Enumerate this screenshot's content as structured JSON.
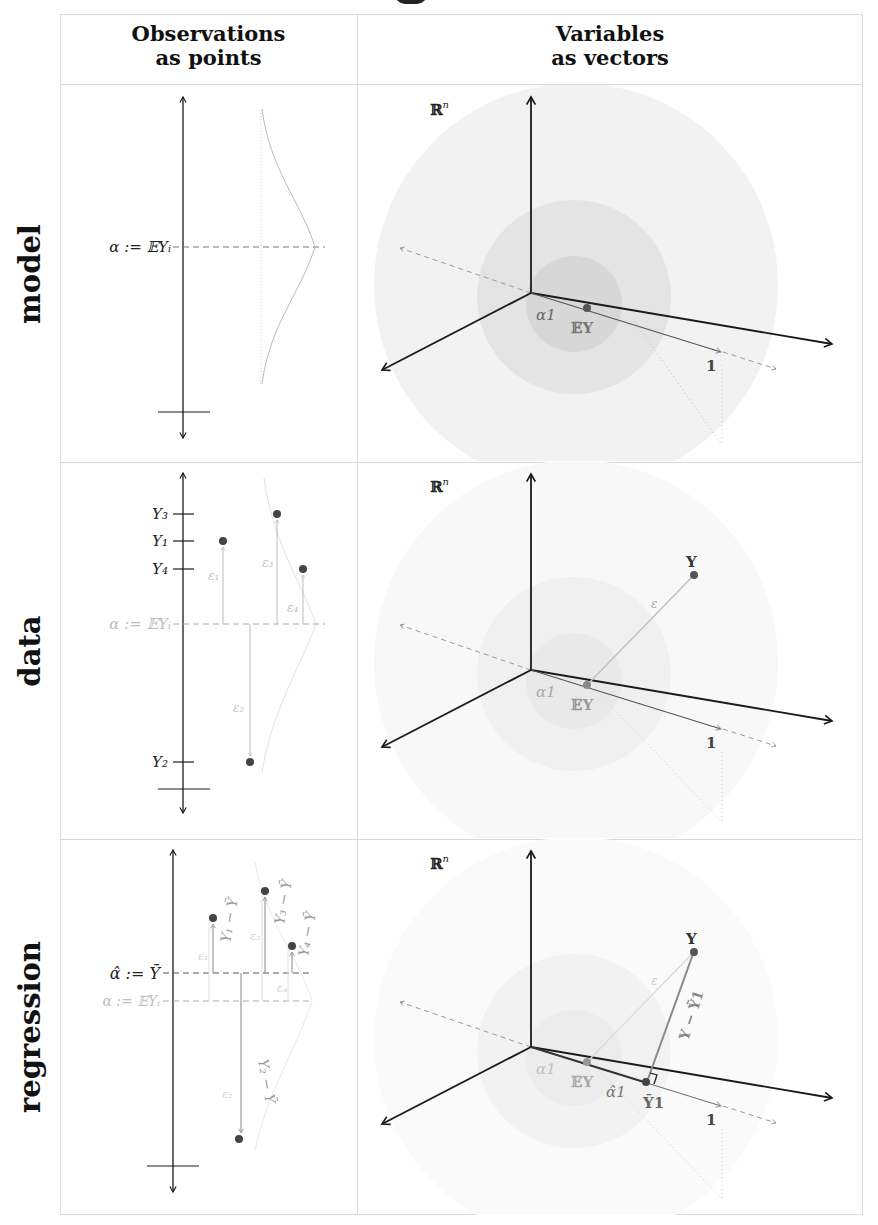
{
  "header": {
    "col_observations": [
      "Observations",
      "as points"
    ],
    "col_variables": [
      "Variables",
      "as vectors"
    ]
  },
  "rows": [
    {
      "label": "model"
    },
    {
      "label": "data"
    },
    {
      "label": "regression"
    }
  ],
  "observations": {
    "model": {
      "alpha_label": "α := 𝔼Yᵢ"
    },
    "data": {
      "alpha_label": "α := 𝔼Yᵢ",
      "tick_labels": [
        "Y₃",
        "Y₁",
        "Y₄",
        "Y₂"
      ],
      "error_labels": [
        "ε₁",
        "ε₂",
        "ε₃",
        "ε₄"
      ]
    },
    "regression": {
      "alpha_hat_label": "α̂ := Ȳ",
      "alpha_label": "α := 𝔼Yᵢ",
      "residual_labels": [
        "Y₁ − Ȳ",
        "Y₂ − Ȳ",
        "Y₃ − Ȳ",
        "Y₄ − Ȳ"
      ],
      "error_labels": [
        "ε₁",
        "ε₂",
        "ε₃",
        "ε₄"
      ]
    }
  },
  "vectors": {
    "space_label": "ℝ",
    "space_exp": "n",
    "alpha_one": "α1",
    "ey": "𝔼Y",
    "one": "1",
    "y": "Y",
    "epsilon": "ε",
    "alpha_hat_one": "α̂1",
    "ybar_one": "Ȳ1",
    "residual": "Y − Ȳ1"
  },
  "colors": {
    "axis": "#1a1a1a",
    "grid_border": "#d9d9d9",
    "faded": "#b5b5b5",
    "sphere_outer": "#f1f1f1",
    "sphere_mid": "#e4e4e4",
    "sphere_inner": "#d6d6d6",
    "point": "#444444"
  }
}
